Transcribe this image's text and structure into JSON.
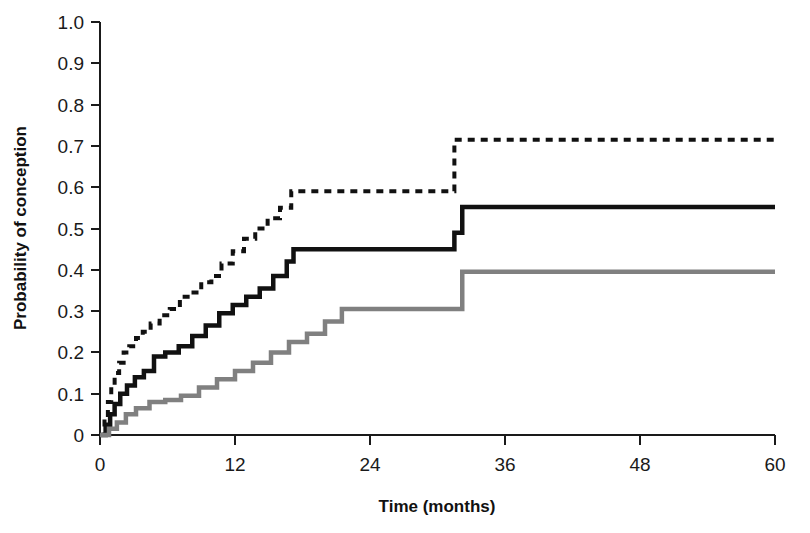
{
  "figure": {
    "background_color": "#ffffff",
    "width": 810,
    "height": 533
  },
  "axes": {
    "y_title": "Probability of conception",
    "x_title": "Time (months)",
    "y_ticks": [
      "0",
      "0.1",
      "0.2",
      "0.3",
      "0.4",
      "0.5",
      "0.6",
      "0.7",
      "0.8",
      "0.9",
      "1.0"
    ],
    "x_ticks": [
      "0",
      "12",
      "24",
      "36",
      "48",
      "60"
    ],
    "axis_color": "#1a1a1a"
  },
  "chart_data": {
    "type": "line",
    "title": "",
    "xlabel": "Time (months)",
    "ylabel": "Probability of conception",
    "xlim": [
      0,
      60
    ],
    "ylim": [
      0,
      1.0
    ],
    "xticks": [
      0,
      12,
      24,
      36,
      48,
      60
    ],
    "yticks": [
      0,
      0.1,
      0.2,
      0.3,
      0.4,
      0.5,
      0.6,
      0.7,
      0.8,
      0.9,
      1.0
    ],
    "grid": false,
    "legend": "none",
    "step_type": "post",
    "series": [
      {
        "name": "Upper curve (dashed black)",
        "style": "dashed",
        "color": "#111111",
        "linewidth": 4,
        "dash_pattern": "7,6",
        "x": [
          0,
          0.4,
          0.7,
          1.0,
          1.3,
          1.7,
          2.1,
          2.6,
          3.2,
          3.8,
          4.5,
          5.3,
          6.2,
          7.1,
          8.0,
          9.0,
          9.9,
          10.8,
          11.8,
          12.8,
          13.8,
          14.9,
          16.0,
          17.0,
          31.5,
          60
        ],
        "y": [
          0,
          0.04,
          0.08,
          0.12,
          0.15,
          0.175,
          0.2,
          0.215,
          0.235,
          0.25,
          0.27,
          0.29,
          0.305,
          0.335,
          0.345,
          0.37,
          0.385,
          0.415,
          0.445,
          0.475,
          0.5,
          0.525,
          0.55,
          0.59,
          0.715,
          0.715
        ]
      },
      {
        "name": "Middle curve (solid black)",
        "style": "solid",
        "color": "#111111",
        "linewidth": 4.5,
        "x": [
          0,
          0.5,
          0.9,
          1.3,
          1.8,
          2.4,
          3.1,
          3.9,
          4.8,
          5.8,
          7.0,
          8.2,
          9.4,
          10.6,
          11.8,
          13.0,
          14.2,
          15.4,
          16.6,
          17.2,
          31.5,
          32.2,
          60
        ],
        "y": [
          0,
          0.025,
          0.05,
          0.075,
          0.1,
          0.12,
          0.14,
          0.155,
          0.19,
          0.2,
          0.215,
          0.24,
          0.265,
          0.295,
          0.315,
          0.335,
          0.355,
          0.385,
          0.42,
          0.45,
          0.49,
          0.552,
          0.552
        ]
      },
      {
        "name": "Lower curve (solid gray)",
        "style": "solid",
        "color": "#808080",
        "linewidth": 4.5,
        "x": [
          0,
          0.8,
          1.5,
          2.3,
          3.2,
          4.4,
          5.8,
          7.2,
          8.8,
          10.4,
          12.0,
          13.6,
          15.2,
          16.8,
          18.4,
          20.0,
          21.5,
          31.4,
          32.2,
          60
        ],
        "y": [
          0,
          0.015,
          0.03,
          0.05,
          0.065,
          0.08,
          0.085,
          0.095,
          0.115,
          0.135,
          0.155,
          0.175,
          0.2,
          0.225,
          0.245,
          0.275,
          0.305,
          0.305,
          0.395,
          0.395
        ]
      }
    ]
  }
}
